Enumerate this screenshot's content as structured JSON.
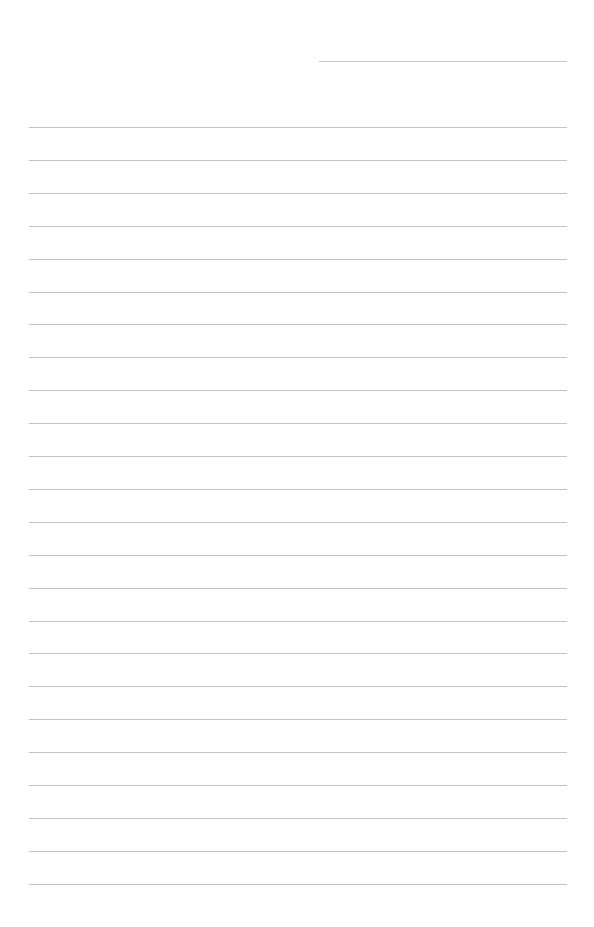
{
  "page": {
    "type": "blank-ruled-sheet",
    "header_line": {
      "label": ""
    },
    "ruled_line_count": 24,
    "ruled_lines": [
      "",
      "",
      "",
      "",
      "",
      "",
      "",
      "",
      "",
      "",
      "",
      "",
      "",
      "",
      "",
      "",
      "",
      "",
      "",
      "",
      "",
      "",
      "",
      ""
    ],
    "colors": {
      "background": "#ffffff",
      "rule": "#c4c4c4"
    }
  }
}
